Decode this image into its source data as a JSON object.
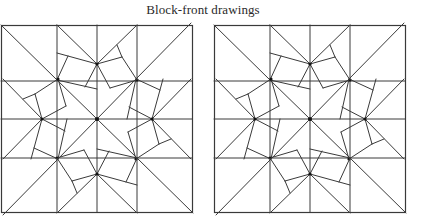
{
  "title": "Block-front drawings",
  "style": {
    "stroke": "#3a3a3a",
    "node": "#111111",
    "background": "#ffffff"
  },
  "panels": [
    {
      "id": "left",
      "offset_x": 0,
      "box": {
        "x0": 1,
        "y0": 25,
        "x1": 192,
        "y1": 212
      },
      "center": [
        97,
        119
      ],
      "verticals": [
        57,
        97,
        137
      ],
      "horizontals": [
        81,
        119,
        158
      ]
    },
    {
      "id": "right",
      "offset_x": 213,
      "box": {
        "x0": 1,
        "y0": 25,
        "x1": 192,
        "y1": 212
      },
      "center": [
        97,
        119
      ],
      "verticals": [
        57,
        97,
        137
      ],
      "horizontals": [
        81,
        119,
        158
      ]
    }
  ],
  "motif_segments": [
    [
      [
        -40,
        -94
      ],
      [
        0,
        -55
      ]
    ],
    [
      [
        -40,
        -66
      ],
      [
        0,
        -55
      ]
    ],
    [
      [
        -29,
        -63
      ],
      [
        -40,
        -39
      ]
    ],
    [
      [
        -40,
        -39
      ],
      [
        0,
        -30
      ]
    ],
    [
      [
        0,
        -55
      ],
      [
        -12,
        -32
      ]
    ],
    [
      [
        40,
        -94
      ],
      [
        0,
        -55
      ]
    ],
    [
      [
        0,
        -55
      ],
      [
        25,
        -62
      ]
    ],
    [
      [
        20,
        -74
      ],
      [
        25,
        -62
      ]
    ],
    [
      [
        25,
        -62
      ],
      [
        40,
        -39
      ]
    ],
    [
      [
        0,
        -55
      ],
      [
        13,
        -31
      ]
    ],
    [
      [
        13,
        -31
      ],
      [
        40,
        -39
      ]
    ],
    [
      [
        -96,
        -94
      ],
      [
        -40,
        -39
      ]
    ],
    [
      [
        0,
        0
      ],
      [
        -40,
        -39
      ]
    ]
  ],
  "nodes": [
    [
      0,
      0
    ],
    [
      0,
      -55
    ],
    [
      40,
      -39
    ]
  ]
}
